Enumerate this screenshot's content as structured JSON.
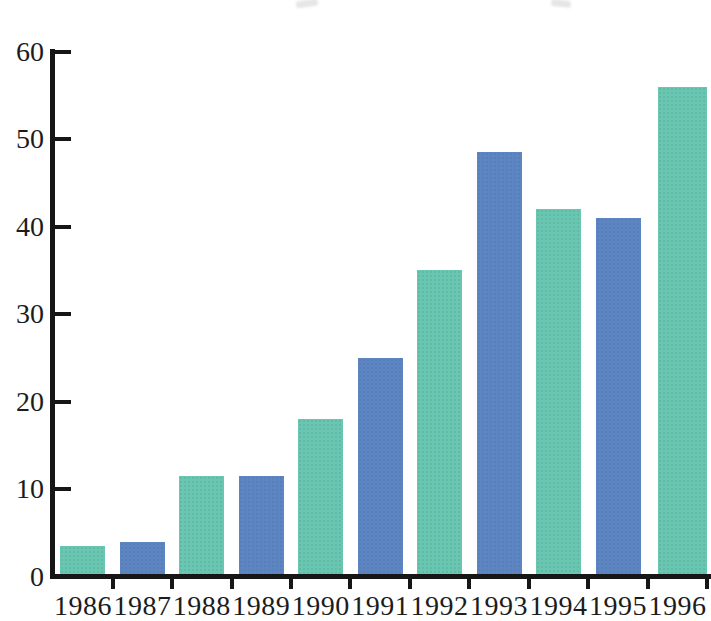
{
  "background": "#ffffff",
  "axis_color": "#161616",
  "text_color": "#1c1c1c",
  "chart_data": {
    "type": "bar",
    "title": "",
    "xlabel": "",
    "ylabel": "",
    "categories": [
      "1986",
      "1987",
      "1988",
      "1989",
      "1990",
      "1991",
      "1992",
      "1993",
      "1994",
      "1995",
      "1996"
    ],
    "values": [
      3.5,
      4,
      11.5,
      11.5,
      18,
      25,
      35,
      48.5,
      42,
      41,
      56
    ],
    "bar_colors": [
      "#69C6B0",
      "#5D85C2",
      "#69C6B0",
      "#5D85C2",
      "#69C6B0",
      "#5D85C2",
      "#69C6B0",
      "#5D85C2",
      "#69C6B0",
      "#5D85C2",
      "#69C6B0"
    ],
    "ylim": [
      0,
      60
    ],
    "yticks": [
      0,
      10,
      20,
      30,
      40,
      50,
      60
    ],
    "grid": false,
    "legend": "none"
  }
}
